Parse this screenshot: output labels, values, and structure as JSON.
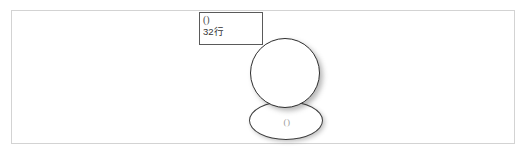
{
  "canvas": {
    "width": 529,
    "height": 155,
    "background_color": "#ffffff",
    "frame_border_color": "#d3d3d3"
  },
  "diagram": {
    "label_box": {
      "line1": "()",
      "line2": "32行",
      "border_color": "#5a5a5a",
      "text_color": "#3a3a3a"
    },
    "circle": {
      "border_color": "#2e2e2e",
      "fill_color": "#ffffff",
      "has_shadow": true
    },
    "ellipse": {
      "label": "()",
      "border_color": "#3d3d3d",
      "fill_color": "#ffffff",
      "label_color": "#9a9a9a",
      "has_shadow": true
    }
  }
}
